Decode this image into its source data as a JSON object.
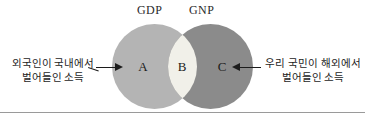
{
  "diagram": {
    "type": "venn",
    "title_left": "GDP",
    "title_right": "GNP",
    "regions": [
      {
        "key": "A",
        "label": "A",
        "meaning": "foreign-nationals-domestic-income",
        "fill": "#b4b4b4"
      },
      {
        "key": "B",
        "label": "B",
        "meaning": "overlap-gdp-gnp",
        "fill": "#f1f0e9"
      },
      {
        "key": "C",
        "label": "C",
        "meaning": "nationals-overseas-income",
        "fill": "#8b8b8b"
      }
    ],
    "annotations": {
      "left": {
        "line1": "외국인이 국내에서",
        "line2": "벌어들인 소득",
        "points_to": "A"
      },
      "right": {
        "line1": "우리 국민이 해외에서",
        "line2": "벌어들인 소득",
        "points_to": "C"
      }
    },
    "colors": {
      "background": "#ffffff",
      "circle_left": "#b4b4b4",
      "circle_right": "#8b8b8b",
      "intersection": "#f1f0e9",
      "text": "#1c1c1c",
      "rule": "#9a9a9a"
    }
  }
}
